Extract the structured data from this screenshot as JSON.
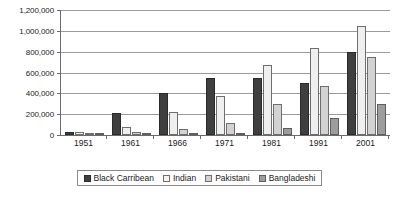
{
  "chart_data": {
    "type": "bar",
    "title": "",
    "subtitle": "",
    "xlabel": "",
    "ylabel": "",
    "categories": [
      "1951",
      "1961",
      "1966",
      "1971",
      "1981",
      "1991",
      "2001"
    ],
    "series": [
      {
        "name": "Black Carribean",
        "color": "#3f3f3f",
        "values": [
          28000,
          210000,
          400000,
          548000,
          545000,
          500000,
          795000
        ]
      },
      {
        "name": "Indian",
        "color": "#efefef",
        "values": [
          31000,
          81000,
          223000,
          375000,
          673000,
          835000,
          1045000
        ]
      },
      {
        "name": "Pakistani",
        "color": "#d2d2d2",
        "values": [
          10000,
          25000,
          62000,
          119000,
          295000,
          474000,
          745000
        ]
      },
      {
        "name": "Bangladeshi",
        "color": "#9d9d9d",
        "values": [
          2000,
          6000,
          10000,
          22000,
          65000,
          160000,
          295000
        ]
      }
    ],
    "ylim": [
      0,
      1200000
    ],
    "ytick_step": 200000,
    "ytick_labels": [
      "0",
      "200,000",
      "400,000",
      "600,000",
      "800,000",
      "1,000,000",
      "1,200,000"
    ],
    "ytick_values": [
      0,
      200000,
      400000,
      600000,
      800000,
      1000000,
      1200000
    ],
    "grid": true,
    "legend_position": "bottom"
  }
}
